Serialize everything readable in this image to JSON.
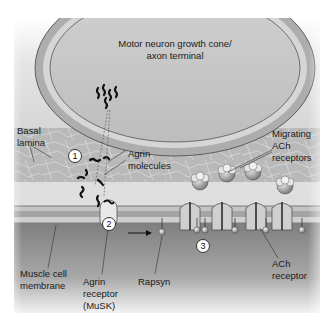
{
  "diagram": {
    "title_label": {
      "line1": "Motor neuron growth cone/",
      "line2": "axon terminal"
    },
    "labels": {
      "basal_lamina": {
        "line1": "Basal",
        "line2": "lamina"
      },
      "agrin_molecules": {
        "line1": "Agrin",
        "line2": "molecules"
      },
      "migrating_ach_receptors": {
        "line1": "Migrating",
        "line2": "ACh",
        "line3": "receptors"
      },
      "muscle_cell_membrane": {
        "line1": "Muscle cell",
        "line2": "membrane"
      },
      "agrin_receptor": {
        "line1": "Agrin",
        "line2": "receptor",
        "line3": "(MuSK)"
      },
      "rapsyn": {
        "line1": "Rapsyn"
      },
      "ach_receptor": {
        "line1": "ACh",
        "line2": "receptor"
      }
    },
    "steps": [
      "1",
      "2",
      "3"
    ],
    "colors": {
      "axon_fill": "#c9c9c9",
      "axon_ring": "#a9a9a9",
      "basal_lamina": "#b8b8b8",
      "cleft": "#dcdcdc",
      "membrane_band": "#b0b0b0",
      "cytoplasm": "#8a8a8a",
      "background": "#ffffff"
    }
  }
}
